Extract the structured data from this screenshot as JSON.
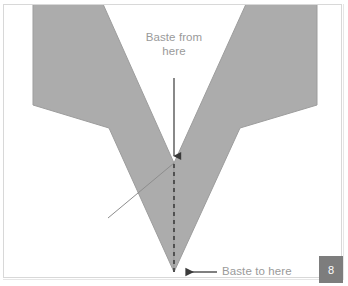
{
  "figure": {
    "type": "sewing-instruction-diagram",
    "step_number": "8",
    "fabric_color": "#acacac",
    "fabric_outline_color": "#9a9a9a",
    "fold_line_color": "#8a8a8a",
    "annotation_color": "#3a3a3a",
    "label_color": "#9a9a9a",
    "badge_background": "#7d7d7d",
    "badge_text_color": "#ffffff",
    "background": "#ffffff",
    "frame_color": "#d8d8d8"
  },
  "labels": {
    "baste_from": "Baste from\nhere",
    "baste_to": "Baste to here"
  },
  "annotations": {
    "vertical_arrow": {
      "name": "baste-from-arrow",
      "from_x": 174,
      "from_y": 78,
      "to_x": 174,
      "to_y": 164,
      "direction": "down"
    },
    "horizontal_arrow": {
      "name": "baste-to-arrow",
      "from_x": 217,
      "from_y": 272,
      "to_x": 177,
      "to_y": 272,
      "direction": "left"
    },
    "dashed_line": {
      "name": "basting-stitch-line",
      "from_x": 174,
      "from_y": 164,
      "to_x": 174,
      "to_y": 272,
      "dash": "4 4"
    }
  },
  "shapes": {
    "left_band": "33,5 103,5 174,163 174,272 109,128 33,105",
    "right_band": "246,5 317,5 317,105 240,128 174,272 174,163",
    "fold_line": "174,163 109,217"
  }
}
